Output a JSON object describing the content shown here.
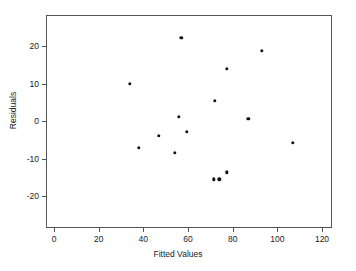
{
  "chart_data": {
    "type": "scatter",
    "title": "",
    "xlabel": "Fitted Values",
    "ylabel": "Residuals",
    "xlim": [
      -6,
      126
    ],
    "ylim": [
      -27,
      26
    ],
    "xticks": [
      0,
      20,
      40,
      60,
      80,
      100,
      120
    ],
    "yticks": [
      20,
      10,
      0,
      -10,
      -20
    ],
    "xtick_labels": [
      "0",
      "20",
      "40",
      "60",
      "80",
      "100",
      "120"
    ],
    "ytick_labels": [
      "20",
      "10",
      "0",
      "-10",
      "-20"
    ],
    "grid": false,
    "legend": null,
    "marker": "filled-circle",
    "marker_color": "#111111",
    "frame_color": "#555555",
    "background": "#ffffff",
    "n_points": 15,
    "x": [
      34,
      38,
      47,
      54,
      56,
      57,
      59.5,
      71.5,
      72,
      74,
      77.5,
      77.5,
      87,
      93,
      107
    ],
    "y": [
      10.0,
      -7.2,
      -3.9,
      -8.5,
      1.1,
      22.2,
      -2.8,
      -15.5,
      5.4,
      -15.5,
      14.0,
      -13.7,
      0.6,
      18.7,
      -5.8
    ],
    "points": [
      {
        "x": 34,
        "y": 10.0
      },
      {
        "x": 38,
        "y": -7.2
      },
      {
        "x": 47,
        "y": -3.9
      },
      {
        "x": 54,
        "y": -8.5
      },
      {
        "x": 56,
        "y": 1.1
      },
      {
        "x": 57,
        "y": 22.2
      },
      {
        "x": 59.5,
        "y": -2.8
      },
      {
        "x": 71.5,
        "y": -15.5
      },
      {
        "x": 72,
        "y": 5.4
      },
      {
        "x": 74,
        "y": -15.5
      },
      {
        "x": 77.5,
        "y": 14.0
      },
      {
        "x": 77.5,
        "y": -13.7
      },
      {
        "x": 87,
        "y": 0.6
      },
      {
        "x": 93,
        "y": 18.7
      },
      {
        "x": 107,
        "y": -5.8
      }
    ]
  }
}
